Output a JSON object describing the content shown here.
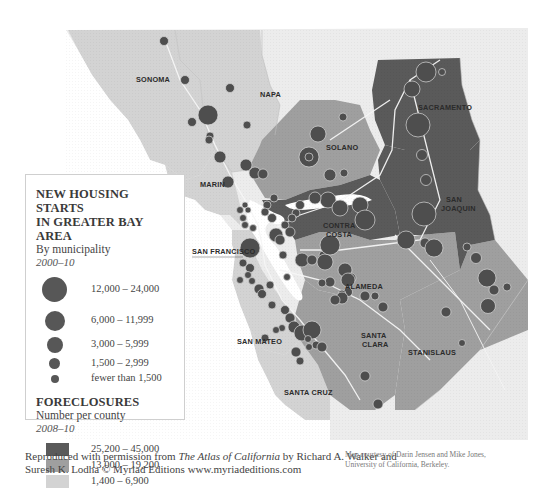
{
  "colors": {
    "high": "#595959",
    "mid": "#9e9e9e",
    "low": "#d6d6d6",
    "outside": "#ececec",
    "water": "#ffffff",
    "dot": "#4f4f4f",
    "road": "#f4f4f4"
  },
  "legend": {
    "housing_title_line1": "NEW HOUSING STARTS",
    "housing_title_line2": "IN GREATER BAY AREA",
    "housing_subtitle": "By municipality",
    "housing_years": "2000–10",
    "housing_classes": [
      {
        "label": "12,000 – 24,000",
        "size": "xl"
      },
      {
        "label": "6,000 – 11,999",
        "size": "l"
      },
      {
        "label": "3,000 – 5,999",
        "size": "m"
      },
      {
        "label": "1,500 – 2,999",
        "size": "s"
      },
      {
        "label": "fewer than 1,500",
        "size": "xs"
      }
    ],
    "foreclosure_title": "FORECLOSURES",
    "foreclosure_subtitle": "Number per county",
    "foreclosure_years": "2008–10",
    "foreclosure_classes": [
      {
        "label": "25,200 – 45,000",
        "shade": "high"
      },
      {
        "label": "13,000 – 19,200",
        "shade": "mid"
      },
      {
        "label": "1,400 – 6,900",
        "shade": "low"
      }
    ]
  },
  "counties": [
    {
      "name": "Sonoma",
      "label": "SONOMA",
      "foreclosure_class": "low"
    },
    {
      "name": "Napa",
      "label": "NAPA",
      "foreclosure_class": "low"
    },
    {
      "name": "Solano",
      "label": "SOLANO",
      "foreclosure_class": "mid"
    },
    {
      "name": "Sacramento",
      "label": "SACRAMENTO",
      "foreclosure_class": "high"
    },
    {
      "name": "Marin",
      "label": "MARIN",
      "foreclosure_class": "low"
    },
    {
      "name": "Contra Costa",
      "label_line1": "CONTRA",
      "label_line2": "COSTA",
      "foreclosure_class": "high"
    },
    {
      "name": "San Joaquin",
      "label_line1": "SAN",
      "label_line2": "JOAQUIN",
      "foreclosure_class": "high"
    },
    {
      "name": "San Francisco",
      "label": "SAN FRANCISCO",
      "foreclosure_class": "low"
    },
    {
      "name": "Alameda",
      "label": "ALAMEDA",
      "foreclosure_class": "mid"
    },
    {
      "name": "San Mateo",
      "label": "SAN MATEO",
      "foreclosure_class": "low"
    },
    {
      "name": "Santa Clara",
      "label_line1": "SANTA",
      "label_line2": "CLARA",
      "foreclosure_class": "mid"
    },
    {
      "name": "Stanislaus",
      "label": "STANISLAUS",
      "foreclosure_class": "mid"
    },
    {
      "name": "Santa Cruz",
      "label": "SANTA CRUZ",
      "foreclosure_class": "low"
    }
  ],
  "credits": {
    "reproduced_prefix": "Reproduced with permission from ",
    "book_title": "The Atlas of California",
    "reproduced_suffix": " by Richard A. Walker and",
    "line2": "Suresh K. Lodha © Myriad Editions www.myriadeditions.com",
    "map_courtesy_line1": "Map courtesy of Darin Jensen and Mike Jones,",
    "map_courtesy_line2": "University of California, Berkeley."
  }
}
